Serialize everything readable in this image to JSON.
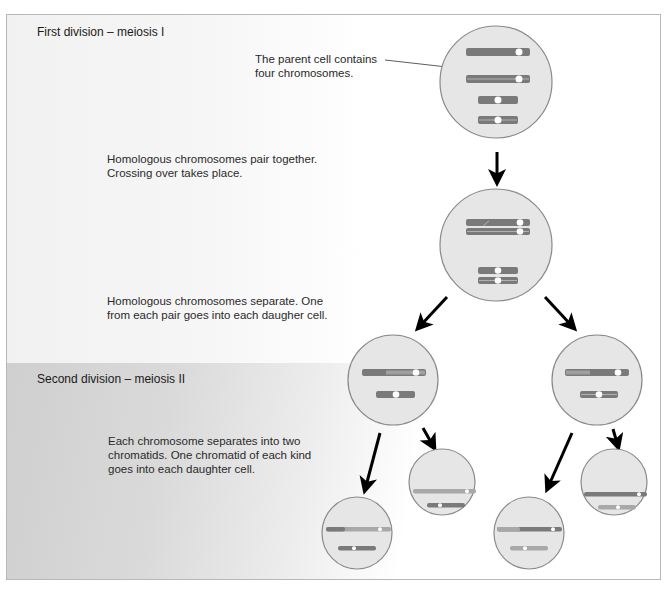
{
  "headings": {
    "first_division": "First division – meiosis I",
    "second_division": "Second division – meiosis II"
  },
  "annotations": {
    "parent_cell_line1": "The parent cell contains",
    "parent_cell_line2": "four chromosomes.",
    "pairing_line1": "Homologous chromosomes pair together.",
    "pairing_line2": "Crossing over takes place.",
    "separate_line1": "Homologous chromosomes separate. One",
    "separate_line2": "from each pair goes into each daugher cell.",
    "chromatids_line1": "Each chromosome separates into two",
    "chromatids_line2": "chromatids. One chromatid of each kind",
    "chromatids_line3": "goes into each daughter cell."
  },
  "colors": {
    "cell_fill": "#e6e6e6",
    "cell_stroke": "#8a8a8a",
    "chromosome_dark": "#7a7a7a",
    "chromosome_light": "#a8a8a8",
    "centromere": "#ffffff",
    "arrow": "#000000",
    "text": "#2a2a2a",
    "frame_border": "#b8b8b8"
  },
  "stages": [
    {
      "name": "parent-cell",
      "chromosomes": 4,
      "description": "The parent cell contains four chromosomes."
    },
    {
      "name": "paired-cell",
      "chromosomes": 4,
      "description": "Homologous chromosomes pair together. Crossing over takes place."
    },
    {
      "name": "meiosis-I-daughters",
      "cells": 2,
      "description": "Homologous chromosomes separate."
    },
    {
      "name": "meiosis-II-daughters",
      "cells": 4,
      "description": "Each chromosome separates into two chromatids."
    }
  ]
}
